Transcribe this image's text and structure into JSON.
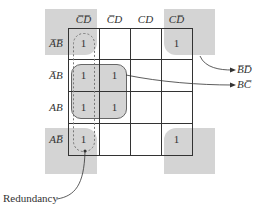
{
  "kmap": {
    "column_headers": [
      {
        "text": "C̅D̅"
      },
      {
        "text": "C̅D"
      },
      {
        "text": "CD"
      },
      {
        "text": "CD̅"
      }
    ],
    "row_headers": [
      {
        "text": "A̅B̅"
      },
      {
        "text": "A̅B"
      },
      {
        "text": "AB"
      },
      {
        "text": "AB̅"
      }
    ],
    "cells": [
      [
        "1",
        "",
        "",
        "1"
      ],
      [
        "1",
        "1",
        "",
        ""
      ],
      [
        "1",
        "1",
        "",
        ""
      ],
      [
        "1",
        "",
        "",
        "1"
      ]
    ]
  },
  "annotations": {
    "group1_label": "B̅D̅",
    "group2_label": "BC̅",
    "redundancy_label": "Redundancy"
  },
  "colors": {
    "group_fill": "#d4d4d4",
    "grid_line": "#333333",
    "background": "#ffffff"
  }
}
